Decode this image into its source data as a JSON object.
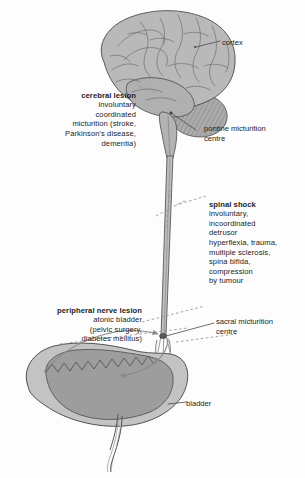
{
  "figure": {
    "background_color": "#fdfdfd",
    "anatomy_fill": "#b9b9b9",
    "anatomy_fill_dark": "#9d9d9d",
    "anatomy_stroke": "#4a4a4a",
    "leader_color": "#4a4a4a",
    "dashed_color": "#8d8d8d",
    "arrow_color": "#8a8a8a",
    "text_color": "#232323"
  },
  "annotations": {
    "cerebral_lesion": {
      "heading": "cerebral lesion",
      "body": "involuntary\ncoordinated\nmicturition (stroke,\nParkinson's disease,\ndementia)",
      "align": "right"
    },
    "spinal_shock": {
      "heading": "spinal shock",
      "body": "involuntary,\nincoordinated\ndetrusor\nhyperflexia, trauma,\nmultiple sclerosis,\nspina bifida,\ncompression\nby tumour",
      "align": "left"
    },
    "peripheral_nerve_lesion": {
      "heading": "peripheral nerve lesion",
      "body": "atonic bladder\n(pelvic surgery,\ndiabetes mellitus)",
      "align": "right"
    }
  },
  "structure_labels": {
    "cortex": "cortex",
    "pontine_micturition_centre": "pontine micturition\ncentre",
    "sacral_micturition_centre": "sacral micturition\ncentre",
    "bladder": "bladder"
  },
  "structures": [
    {
      "name": "cerebrum",
      "description": "cerebral hemisphere with gyri and sulci"
    },
    {
      "name": "cerebellum",
      "description": "hatched folia, posterior-inferior to cerebrum"
    },
    {
      "name": "brainstem",
      "description": "pons and medulla continuing into spinal cord"
    },
    {
      "name": "spinal-cord",
      "description": "long tapering cord to sacral level"
    },
    {
      "name": "bladder",
      "description": "urinary bladder with wall and lumen, urethra below"
    }
  ],
  "pathway_arrows": [
    {
      "name": "afferent-arrow",
      "from": "bladder",
      "to": "sacral-micturition-centre"
    },
    {
      "name": "efferent-arrow",
      "from": "sacral-micturition-centre",
      "to": "bladder"
    }
  ],
  "lesion_markers": [
    {
      "name": "cerebral-lesion-marker",
      "target": "brainstem-upper"
    },
    {
      "name": "spinal-shock-marker",
      "target": "spinal-cord-mid"
    },
    {
      "name": "peripheral-nerve-lesion-marker",
      "target": "bladder-nerve-supply"
    }
  ]
}
